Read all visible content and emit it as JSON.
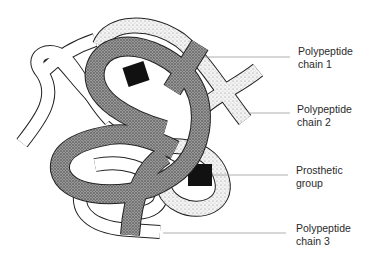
{
  "figure": {
    "colors": {
      "chain1_fill": "#8e8e8e",
      "chain2_fill": "#e6e6e6",
      "chain3_fill": "#ffffff",
      "prosthetic_group": "#111111",
      "outline": "#222222",
      "leader_line": "#9a9a9a"
    },
    "labels": [
      {
        "id": "chain-1",
        "line1": "Polypeptide",
        "line2": "chain 1"
      },
      {
        "id": "chain-2",
        "line1": "Polypeptide",
        "line2": "chain 2"
      },
      {
        "id": "prosthetic-group",
        "line1": "Prosthetic",
        "line2": "group"
      },
      {
        "id": "chain-3",
        "line1": "Polypeptide",
        "line2": "chain 3"
      }
    ]
  }
}
